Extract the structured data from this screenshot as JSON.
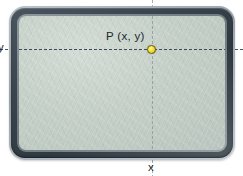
{
  "diagram": {
    "type": "coordinate-plane-on-board",
    "labels": {
      "point": "P (x, y)",
      "x_axis": "x",
      "y_axis": "y"
    },
    "point": {
      "name": "P",
      "coordinates": "(x, y)",
      "pixel_x": 152,
      "pixel_y": 50,
      "marker_color": "#f3e23a",
      "marker_outline_color": "#6e5c12"
    },
    "axes": {
      "horizontal": {
        "name": "y-axis-reference-line",
        "style": "dashed",
        "color": "#3f4c57",
        "pixel_y": 49
      },
      "vertical": {
        "name": "x-axis-reference-line",
        "style": "dashed",
        "color": "#93a6a3",
        "pixel_x": 152
      }
    },
    "board": {
      "frame_color": "#39434c",
      "surface_color": "#c4cfc7",
      "corner_style": "rounded"
    }
  }
}
